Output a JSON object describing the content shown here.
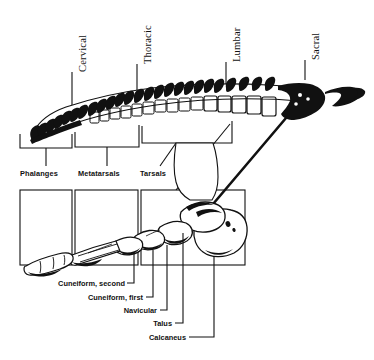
{
  "figure": {
    "type": "anatomical-illustration",
    "ink_color": "#111111",
    "background_color": "#ffffff"
  },
  "spine_labels": [
    {
      "name": "cervical",
      "text": "Cervical",
      "leader_x": 72,
      "leader_top": 72,
      "leader_bottom": 121
    },
    {
      "name": "thoracic",
      "text": "Thoracic",
      "leader_x": 137,
      "leader_top": 64,
      "leader_bottom": 90
    },
    {
      "name": "lumbar",
      "text": "Lumbar",
      "leader_x": 226,
      "leader_top": 62,
      "leader_bottom": 90
    },
    {
      "name": "sacral",
      "text": "Sacral",
      "leader_x": 305,
      "leader_top": 60,
      "leader_bottom": 80
    }
  ],
  "region_labels": [
    {
      "name": "phalanges",
      "text": "Phalanges"
    },
    {
      "name": "metatarsals",
      "text": "Metatarsals"
    },
    {
      "name": "tarsals",
      "text": "Tarsals"
    }
  ],
  "bone_callouts": [
    {
      "name": "cuneiform-second",
      "text": "Cuneiform, second"
    },
    {
      "name": "cuneiform-first",
      "text": "Cuneiform, first"
    },
    {
      "name": "navicular",
      "text": "Navicular"
    },
    {
      "name": "talus",
      "text": "Talus"
    },
    {
      "name": "calcaneus",
      "text": "Calcaneus"
    }
  ]
}
